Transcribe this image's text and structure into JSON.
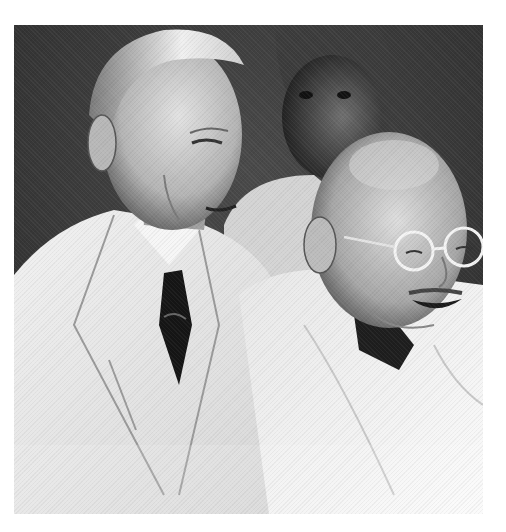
{
  "image": {
    "kind": "black-and-white historical photograph",
    "alt": "Two elderly men in white clothing smiling together; a man in a light suit with dark tie on the left, a bald man with round spectacles wrapped in a white shawl on the right, and a turbaned man in the background",
    "palette": {
      "background_dark": "#3a3a3a",
      "suit_white": "#ececec",
      "shadow": "#1e1e1e",
      "skin_light": "#d8d8d8",
      "skin_mid": "#a8a8a8"
    },
    "subjects": [
      {
        "id": "left-man",
        "description": "Thin elderly man with slicked-back white hair, light double-breasted suit, dark patterned tie"
      },
      {
        "id": "right-man",
        "description": "Bald elderly man with round wire spectacles, broad smile, white shawl"
      },
      {
        "id": "background-man",
        "description": "Man in turban standing behind, partially shadowed"
      }
    ]
  }
}
